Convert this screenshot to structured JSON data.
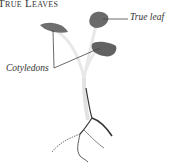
{
  "title": "True Leaves",
  "labels": {
    "true_leaf": "True leaf",
    "cotyledons": "Cotyledons"
  },
  "colors": {
    "leaf": "#6b6b6b",
    "stem": "#e6e6e6",
    "root": "#333333",
    "text": "#333333"
  }
}
